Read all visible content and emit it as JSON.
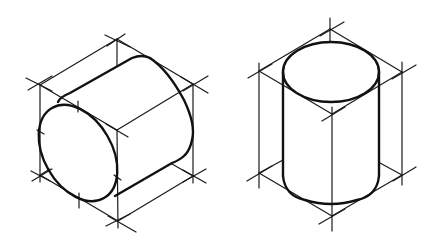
{
  "figure": {
    "title": "Isometric cylinders with construction boxes",
    "colors": {
      "background": "#ffffff",
      "line": "#111111"
    },
    "drawings": [
      {
        "name": "horizontal-cylinder",
        "orientation": "horizontal",
        "box_vertices": {
          "top": [
            117,
            39
          ],
          "upper_left": [
            40,
            85
          ],
          "upper_right": [
            193,
            84
          ],
          "center": [
            117,
            130
          ],
          "lower_left": [
            40,
            175
          ],
          "lower_right": [
            193,
            176
          ],
          "bottom": [
            118,
            221
          ]
        }
      },
      {
        "name": "vertical-cylinder",
        "orientation": "vertical",
        "box_vertices": {
          "top": [
            330,
            29
          ],
          "upper_left": [
            259,
            71
          ],
          "upper_right": [
            402,
            72
          ],
          "center": [
            332,
            114
          ],
          "lower_left": [
            259,
            173
          ],
          "lower_right": [
            402,
            175
          ],
          "bottom": [
            332,
            216
          ]
        }
      }
    ]
  }
}
